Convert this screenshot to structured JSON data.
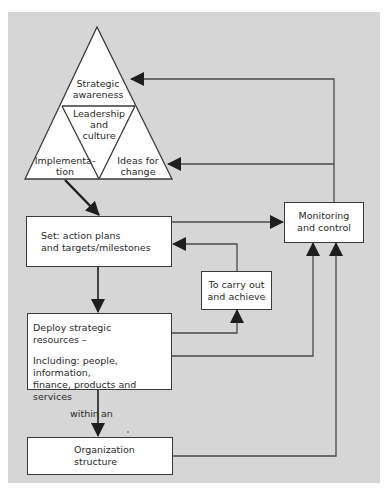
{
  "diagram": {
    "triangle": {
      "top": {
        "line1": "Strategic",
        "line2": "awareness"
      },
      "center": {
        "line1": "Leadership",
        "line2": "and",
        "line3": "culture"
      },
      "bottom_left": {
        "line1": "Implementa-",
        "line2": "tion"
      },
      "bottom_right": {
        "line1": "Ideas for",
        "line2": "change"
      }
    },
    "boxes": {
      "set": {
        "line1": "Set: action plans",
        "line2": "and targets/milestones"
      },
      "carry": {
        "line1": "To carry out",
        "line2": "and achieve"
      },
      "monitoring": {
        "line1": "Monitoring",
        "line2": "and control"
      },
      "deploy": {
        "line1": "Deploy strategic",
        "line2": "resources –",
        "line3": "Including: people, information,",
        "line4": "finance, products and services"
      },
      "organization": {
        "line1": "Organization",
        "line2": "structure"
      }
    },
    "connector_labels": {
      "within_left": "within",
      "within_right": "an"
    },
    "colors": {
      "background": "#d6d6d6",
      "line": "#3a3a3a",
      "box_fill": "#ffffff",
      "text": "#2a2a2a"
    }
  }
}
